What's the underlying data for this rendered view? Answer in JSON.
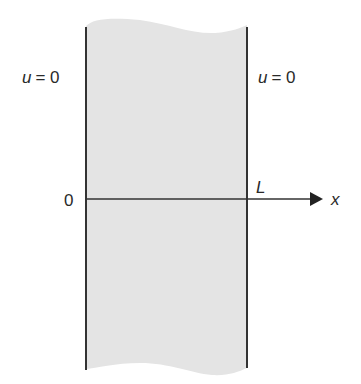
{
  "diagram": {
    "type": "slab-domain",
    "colors": {
      "slab_fill": "#e4e4e4",
      "lines": "#333333",
      "text": "#2a2a2a",
      "background": "#ffffff"
    },
    "labels": {
      "left_bc": {
        "var": "u",
        "eq": "= 0"
      },
      "right_bc": {
        "var": "u",
        "eq": "= 0"
      },
      "origin": "0",
      "length": "L",
      "axis": "x"
    }
  }
}
